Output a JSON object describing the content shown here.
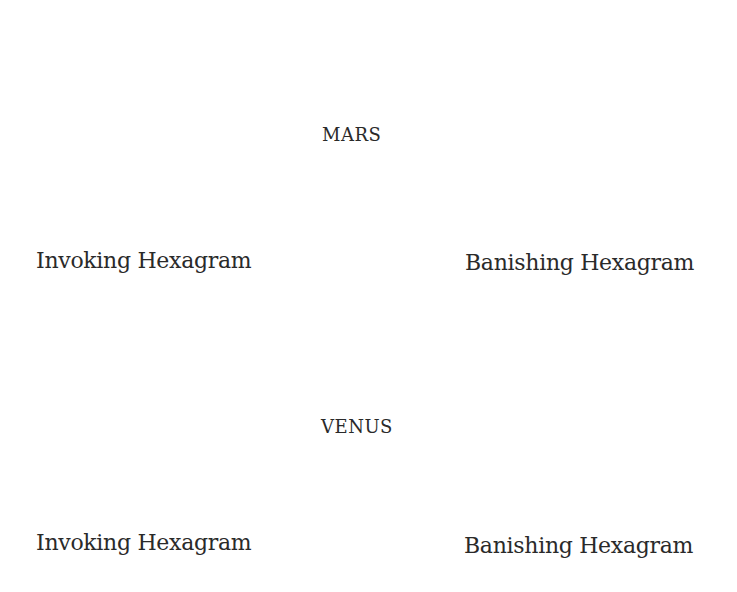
{
  "colors": {
    "background": "#ffffff",
    "line": "#141414",
    "text": "#2a2a2a"
  },
  "rows": [
    {
      "planet": "MARS",
      "planet_pos": {
        "x": 322,
        "y": 124
      },
      "invoking": {
        "caption": "Invoking Hexagram",
        "caption_pos": {
          "x": 36,
          "y": 248
        },
        "up_triangle": [
          [
            147,
            38
          ],
          [
            226,
            184
          ],
          [
            65,
            184
          ]
        ],
        "down_triangle": [
          [
            67,
            85
          ],
          [
            229,
            85
          ],
          [
            149,
            231
          ]
        ],
        "arrows": [
          {
            "label": "1",
            "from": [
              70,
              63
            ],
            "to": [
              127,
              63
            ],
            "label_pos": [
              48,
              73
            ]
          },
          {
            "label": "2",
            "from": [
              227,
              199
            ],
            "to": [
              172,
              199
            ],
            "label_pos": [
              229,
              208
            ]
          }
        ]
      },
      "banishing": {
        "caption": "Banishing Hexagram",
        "caption_pos": {
          "x": 465,
          "y": 250
        },
        "up_triangle": [
          [
            576,
            41
          ],
          [
            655,
            186
          ],
          [
            495,
            186
          ]
        ],
        "down_triangle": [
          [
            498,
            88
          ],
          [
            658,
            88
          ],
          [
            578,
            234
          ]
        ],
        "arrows": [
          {
            "label": "1",
            "from": [
              478,
              91
            ],
            "to": [
              508,
              138
            ],
            "label_pos": [
              481,
              85
            ]
          },
          {
            "label": "2",
            "from": [
              669,
              181
            ],
            "to": [
              646,
              136
            ],
            "label_pos": [
              654,
              207
            ]
          }
        ]
      }
    },
    {
      "planet": "VENUS",
      "planet_pos": {
        "x": 321,
        "y": 416
      },
      "invoking": {
        "caption": "Invoking Hexagram",
        "caption_pos": {
          "x": 36,
          "y": 530
        },
        "up_triangle": [
          [
            137,
            322
          ],
          [
            216,
            466
          ],
          [
            57,
            466
          ]
        ],
        "down_triangle": [
          [
            60,
            368
          ],
          [
            219,
            368
          ],
          [
            140,
            513
          ]
        ],
        "arrows": [
          {
            "label": "2",
            "from": [
              63,
              350
            ],
            "to": [
              115,
              350
            ],
            "label_pos": [
              41,
              376
            ]
          },
          {
            "label": "1",
            "from": [
              218,
              482
            ],
            "to": [
              167,
              482
            ],
            "label_pos": [
              219,
              492
            ]
          }
        ]
      },
      "banishing": {
        "caption": "Banishing Hexagram",
        "caption_pos": {
          "x": 464,
          "y": 533
        },
        "up_triangle": [
          [
            578,
            322
          ],
          [
            656,
            468
          ],
          [
            499,
            468
          ]
        ],
        "down_triangle": [
          [
            501,
            368
          ],
          [
            661,
            368
          ],
          [
            581,
            513
          ]
        ],
        "arrows": [
          {
            "label": "2",
            "from": [
              483,
              378
            ],
            "to": [
              512,
              425
            ],
            "label_pos": [
              481,
              376
            ]
          },
          {
            "label": "1",
            "from": [
              678,
              466
            ],
            "to": [
              650,
              417
            ],
            "label_pos": [
              662,
              494
            ]
          }
        ]
      }
    }
  ]
}
